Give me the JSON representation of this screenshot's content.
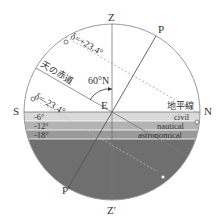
{
  "diagram": {
    "points": {
      "zenith": "Z",
      "nadir": "Z′",
      "north_pole": "P",
      "south_pole": "P′",
      "south": "S",
      "north": "N",
      "east": "E"
    },
    "latitude_label": "60°N",
    "declination_upper": "δ=+23.4°",
    "declination_lower": "δ=-23.4°",
    "celestial_equator": "天の赤道",
    "horizon": "地平線",
    "bands": [
      {
        "name": "civil",
        "label": "civil",
        "angle": "-6°",
        "color": "#cfcfcf"
      },
      {
        "name": "nautical",
        "label": "nautical",
        "angle": "-12°",
        "color": "#a9a9a9"
      },
      {
        "name": "astronomical",
        "label": "astronomical",
        "angle": "-18°",
        "color": "#8a8a8a"
      }
    ],
    "below_horizon_color": "#6e6e6e",
    "line_color": "#888888"
  }
}
